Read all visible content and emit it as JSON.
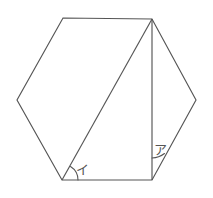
{
  "figure": {
    "kind": "hexagon-with-diagonal",
    "background_color": "#ffffff",
    "stroke_color": "#555555",
    "hexagon": {
      "name": "regular-hexagon",
      "vertices": [
        {
          "name": "top-left",
          "x": 63,
          "y": 18
        },
        {
          "name": "top-right",
          "x": 152,
          "y": 19
        },
        {
          "name": "right",
          "x": 196,
          "y": 100
        },
        {
          "name": "bottom-right",
          "x": 152,
          "y": 180
        },
        {
          "name": "bottom-left",
          "x": 62,
          "y": 180
        },
        {
          "name": "left",
          "x": 17,
          "y": 100
        }
      ],
      "path": "M 63 18 L 152 19 L 196 100 L 152 180 L 62 180 L 17 100 Z"
    },
    "diagonal": {
      "name": "diagonal-top-right-to-bottom-left",
      "path": "M 152 19 L 62 180"
    },
    "vertical": {
      "name": "vertical-top-right-to-bottom-right",
      "path": "M 152 19 L 152 180"
    },
    "angles": [
      {
        "id": "angle-i",
        "label": "イ",
        "vertex": "bottom-left",
        "label_x": 82,
        "label_y": 170,
        "arc_path": "M 78 180 A 16 16 0 0 0 70.5 166.5"
      },
      {
        "id": "angle-a",
        "label": "ア",
        "vertex": "bottom-right",
        "label_x": 160,
        "label_y": 150,
        "arc_path": "M 152 158 A 22 22 0 0 0 164.5 153.5"
      }
    ]
  }
}
